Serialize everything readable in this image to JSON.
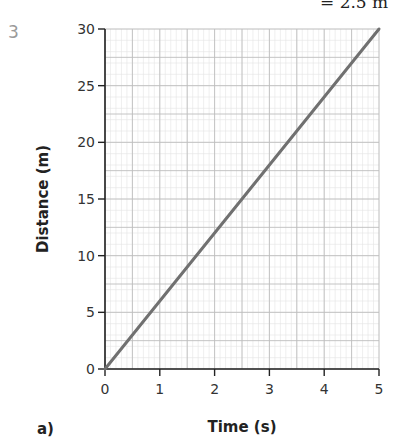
{
  "fragment": {
    "top_text": "= 2.5 m"
  },
  "question": {
    "number": "3",
    "part": "a)"
  },
  "chart_data": {
    "type": "line",
    "title": "",
    "xlabel": "Time (s)",
    "ylabel": "Distance (m)",
    "xlim": [
      0,
      5
    ],
    "ylim": [
      0,
      30
    ],
    "x_ticks": [
      0,
      1,
      2,
      3,
      4,
      5
    ],
    "y_ticks": [
      0,
      5,
      10,
      15,
      20,
      25,
      30
    ],
    "grid": true,
    "grid_minor_step": {
      "x": 0.1,
      "y": 1
    },
    "series": [
      {
        "name": "distance",
        "x": [
          0,
          5
        ],
        "values": [
          0,
          30
        ],
        "color": "#707070"
      }
    ]
  }
}
